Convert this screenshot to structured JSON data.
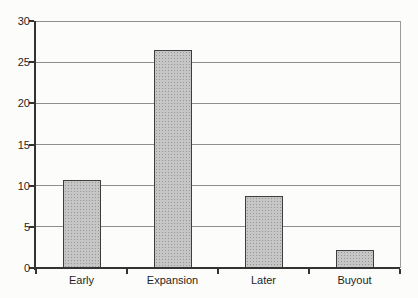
{
  "chart_data": {
    "type": "bar",
    "title": "",
    "xlabel": "",
    "ylabel": "",
    "categories": [
      "Early",
      "Expansion",
      "Later",
      "Buyout"
    ],
    "values": [
      10.7,
      26.5,
      8.8,
      2.2
    ],
    "ylim": [
      0,
      30
    ],
    "yticks": [
      0,
      5,
      10,
      15,
      20,
      25,
      30
    ],
    "ytick_labels": [
      "0",
      "5",
      "10",
      "15",
      "20",
      "25",
      "30"
    ],
    "grid": true,
    "legend": "none",
    "colors": {
      "background": "#fcfcfa",
      "bar_fill": "#c6c6c6",
      "bar_dot": "#969696",
      "bar_border": "#3e3e3e",
      "gridline": "#8f8f8f",
      "axis": "#333333",
      "plot_border_right": "#9b9b9b",
      "tick": "#333333",
      "text": "#1f1f1f"
    }
  }
}
